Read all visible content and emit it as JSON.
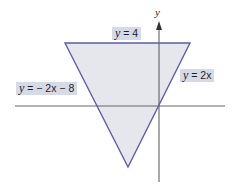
{
  "diagram": {
    "type": "coordinate-plane-region",
    "axes": {
      "y_label": "y"
    },
    "lines": [
      {
        "id": "top",
        "equation": "y = 4",
        "label_var": "y",
        "label_rest": " = 4"
      },
      {
        "id": "right",
        "equation": "y = 2x",
        "label_var": "y",
        "label_rest": " = 2x"
      },
      {
        "id": "left",
        "equation": "y = −2x − 8",
        "label_var": "y",
        "label_rest": " = − 2x − 8"
      }
    ],
    "colors": {
      "boundary": "#5a5fa8",
      "fill": "#e6e7ec",
      "label_background": "#d6d9e6",
      "axis": "#555555"
    }
  }
}
